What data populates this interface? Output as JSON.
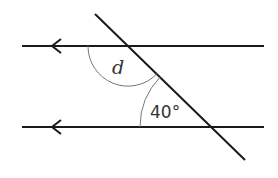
{
  "diagram": {
    "type": "parallel-lines-transversal",
    "colors": {
      "line": "#1a1a1a",
      "arc": "#777777",
      "text": "#333333",
      "background": "#ffffff"
    },
    "lines": {
      "top": {
        "x1": 22,
        "y1": 46,
        "x2": 264,
        "y2": 46,
        "arrow_tip_x": 52
      },
      "bottom": {
        "x1": 22,
        "y1": 127,
        "x2": 264,
        "y2": 127,
        "arrow_tip_x": 52
      },
      "transversal": {
        "x1": 95,
        "y1": 14,
        "x2": 245,
        "y2": 160
      }
    },
    "angles": {
      "unknown": {
        "label": "d",
        "label_x": 112,
        "label_y": 74
      },
      "given": {
        "label": "40°",
        "label_x": 150,
        "label_y": 118,
        "value_degrees": 40
      }
    }
  }
}
